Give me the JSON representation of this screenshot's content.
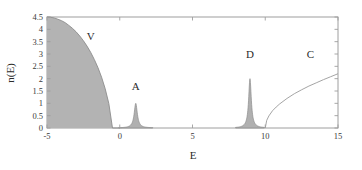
{
  "chart_data": {
    "type": "line",
    "title": "",
    "xlabel": "E",
    "ylabel": "n(E)",
    "xlim": [
      -5,
      15
    ],
    "ylim": [
      0,
      4.5
    ],
    "grid": false,
    "legend": "none",
    "xticks": [
      -5,
      0,
      5,
      10,
      15
    ],
    "xtick_labels": [
      "-5",
      "0",
      "5",
      "10",
      "15"
    ],
    "yticks": [
      0,
      0.5,
      1,
      1.5,
      2,
      2.5,
      3,
      3.5,
      4,
      4.5
    ],
    "ytick_labels": [
      "0",
      "0.5",
      "1",
      "1.5",
      "2",
      "2.5",
      "3",
      "3.5",
      "4",
      "4.5"
    ],
    "annotations": [
      {
        "text": "V",
        "x": -2.0,
        "y": 3.55,
        "note": "filled valence band region"
      },
      {
        "text": "A",
        "x": 1.1,
        "y": 1.55,
        "note": "acceptor impurity peak"
      },
      {
        "text": "D",
        "x": 8.95,
        "y": 2.85,
        "note": "donor impurity peak"
      },
      {
        "text": "C",
        "x": 13.1,
        "y": 2.85,
        "note": "conduction band region"
      }
    ],
    "series": [
      {
        "name": "valence-band",
        "label": "V",
        "fill": true,
        "fill_color": "#b3b3b3",
        "line_color": "#8c8c8c",
        "description": "Filled quarter-ellipse density of states from E=-5 (n=4.5) falling to zero at E=0",
        "x": [
          -5.0,
          -4.75,
          -4.5,
          -4.25,
          -4.0,
          -3.75,
          -3.5,
          -3.25,
          -3.0,
          -2.75,
          -2.5,
          -2.25,
          -2.0,
          -1.75,
          -1.5,
          -1.25,
          -1.0,
          -0.75,
          -0.5,
          -0.25,
          -0.1,
          0.0
        ],
        "y": [
          4.5,
          4.49,
          4.46,
          4.41,
          4.35,
          4.27,
          4.16,
          4.04,
          3.9,
          3.73,
          3.54,
          3.32,
          3.07,
          2.78,
          2.45,
          2.06,
          1.59,
          0.99,
          0.0,
          0.0,
          0.0,
          0.0
        ]
      },
      {
        "name": "acceptor-peak",
        "label": "A",
        "fill": false,
        "line_color": "#8c8c8c",
        "description": "Narrow Lorentzian peak centred at E=1.1 with height n=1.0",
        "center": 1.1,
        "height": 1.0,
        "halfwidth": 0.13
      },
      {
        "name": "donor-peak",
        "label": "D",
        "fill": false,
        "line_color": "#8c8c8c",
        "description": "Narrow Lorentzian peak centred at E=8.95 with height n=2.0",
        "center": 8.95,
        "height": 2.0,
        "halfwidth": 0.11
      },
      {
        "name": "conduction-band",
        "label": "C",
        "fill": false,
        "line_color": "#9a9a9a",
        "description": "Square-root band edge rising from E=10 (n=0) to E=15 (n=2.2)",
        "x": [
          10.0,
          10.1,
          10.25,
          10.5,
          10.75,
          11.0,
          11.5,
          12.0,
          12.5,
          13.0,
          13.5,
          14.0,
          14.5,
          15.0
        ],
        "y": [
          0.0,
          0.31,
          0.49,
          0.7,
          0.85,
          0.98,
          1.2,
          1.39,
          1.55,
          1.7,
          1.83,
          1.96,
          2.08,
          2.2
        ]
      }
    ],
    "colors": {
      "fill": "#b3b3b3",
      "line": "#8c8c8c",
      "frame": "#9e9e9e",
      "text": "#2b2b2b",
      "background": "#ffffff"
    }
  }
}
